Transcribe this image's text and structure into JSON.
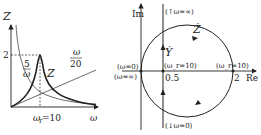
{
  "left_plot": {
    "y_axis_label": "Z",
    "x_axis_label": "ω",
    "y_tick": "2",
    "resonance_label": "ω_r=10",
    "resonance_sub": "r",
    "resonance_value": "=10",
    "omega": "ω",
    "curve_z_label": "Z",
    "curve_capacitive_num": "5",
    "curve_capacitive_den": "ω",
    "curve_inductive_num": "ω",
    "curve_inductive_den": "20"
  },
  "right_plot": {
    "y_axis_label": "Im",
    "x_axis_label": "Re",
    "impedance_locus_label": "Ż",
    "admittance_locus_label": "Ẏ",
    "top_annotation": "(↑ω=∞)",
    "bottom_annotation": "(↓ω=0)",
    "left_annotation_top": "(ω=0)",
    "left_annotation_bottom": "(ω=∞)",
    "center_annotation": "(ω_r=10)",
    "right_annotation": "(ω_r=10)",
    "tick_half": "0.5",
    "tick_two": "2",
    "center_text": "(ω",
    "center_sub": "r",
    "center_tail": "=10)"
  },
  "colors": {
    "stroke": "#222222",
    "background": "#ffffff"
  }
}
